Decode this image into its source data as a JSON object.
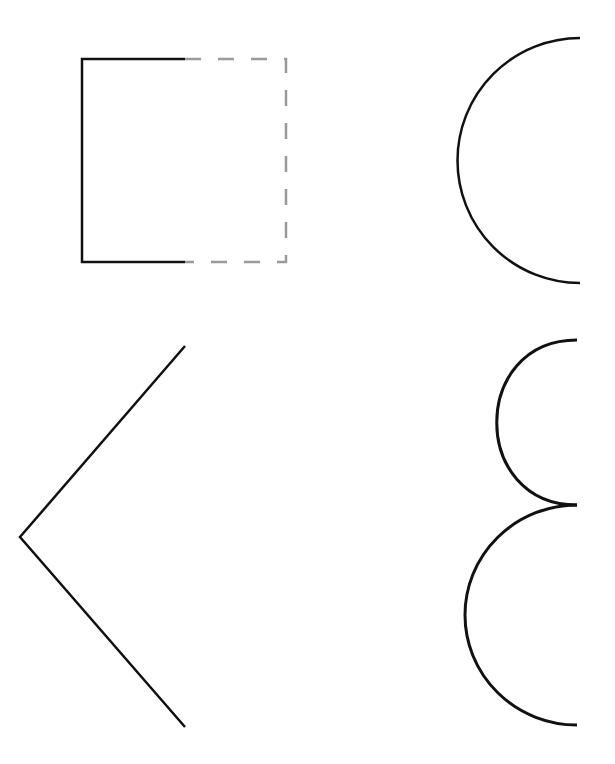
{
  "canvas": {
    "width": 615,
    "height": 764,
    "background": "#ffffff"
  },
  "colors": {
    "solid": "#111111",
    "dashed": "#9a9a9a"
  },
  "shapes": {
    "square_bracket": {
      "solid_path": "M185 59 L82 59 L82 262 L185 262",
      "dashed_path": "M185 59 L286 59 L286 262 L185 262",
      "dash_pattern": "16 17"
    },
    "top_arc": {
      "path": "M580 38 A122 122 0 0 0 580 283"
    },
    "chevron": {
      "path": "M185 346 L20 537 L185 727"
    },
    "small_arc": {
      "path": "M577 340 C 470 340, 470 505, 577 505"
    },
    "large_arc": {
      "path": "M577 505 A112 110 0 0 0 577 725"
    }
  }
}
